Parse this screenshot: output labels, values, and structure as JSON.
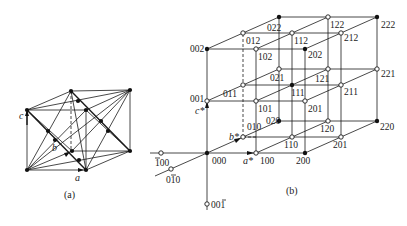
{
  "figure_a": {
    "caption": "(a)",
    "axis_labels": {
      "a": "a",
      "b": "b",
      "c": "c"
    }
  },
  "figure_b": {
    "caption": "(b)",
    "axis_labels": {
      "a": "a*",
      "b": "b*",
      "c": "c*"
    },
    "points": {
      "000": "000",
      "100": "100",
      "200": "200",
      "010": "010",
      "020": "020",
      "001": "001",
      "002": "002",
      "110": "110",
      "120": "120",
      "220": "220",
      "201": "201",
      "011": "011",
      "021": "021",
      "101": "101",
      "111": "111",
      "121": "121",
      "211": "211",
      "221": "221",
      "012": "012",
      "022": "022",
      "102": "102",
      "112": "112",
      "122": "122",
      "202": "202",
      "212": "212",
      "222": "222",
      "m100": "100",
      "m010": "010",
      "m001": "001"
    },
    "filled_points": [
      "000",
      "002",
      "200",
      "020",
      "220",
      "111",
      "202",
      "022",
      "222"
    ]
  }
}
